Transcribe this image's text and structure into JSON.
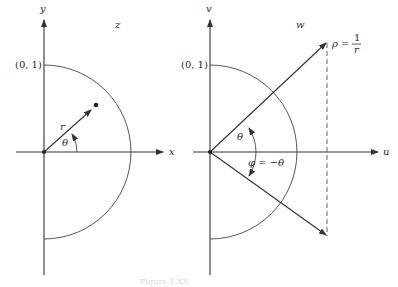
{
  "left_panel": {
    "plane_label": "z",
    "x_axis_label": "x",
    "y_axis_label": "y",
    "unit_point_label": "(0, 1)",
    "radius_label": "r",
    "angle_label": "θ"
  },
  "right_panel": {
    "plane_label": "w",
    "u_axis_label": "u",
    "v_axis_label": "v",
    "unit_point_label": "(0, 1)",
    "angle_label": "θ",
    "rho_label": "ρ =",
    "rho_numerator": "1",
    "rho_denominator": "r",
    "phi_label": "φ = −θ"
  },
  "caption": "Figure 1.XX",
  "colors": {
    "ink": "#333333",
    "background": "#ffffff"
  }
}
